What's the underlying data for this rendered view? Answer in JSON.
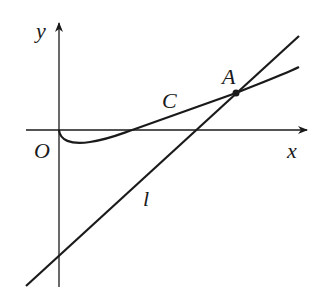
{
  "figure": {
    "type": "coordinate-diagram",
    "labels": {
      "y_axis": "y",
      "x_axis": "x",
      "origin": "O",
      "curve": "C",
      "line": "l",
      "point": "A"
    },
    "elements": {
      "axes": {
        "x_axis_arrow": true,
        "y_axis_arrow": true
      },
      "curve_C": {
        "description": "curve starting at origin, dipping below x-axis, then rising to cross x-axis and pass through A"
      },
      "line_l": {
        "description": "straight line with positive slope, negative y-intercept, passing through A"
      },
      "point_A": {
        "description": "intersection / tangency-like point of curve C and line l in first quadrant"
      }
    },
    "colors": {
      "stroke": "#1a1a1a",
      "background": "#ffffff"
    }
  }
}
